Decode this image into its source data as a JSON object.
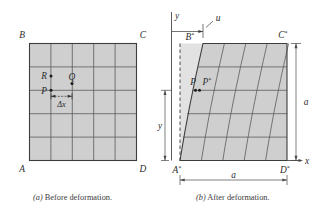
{
  "figure": {
    "captions": {
      "a_prefix": "(a)",
      "a_text": "Before deformation.",
      "b_prefix": "(b)",
      "b_text": "After deformation."
    },
    "colors": {
      "fill": "#cfcfcf",
      "fill_shadow": "#dcdcdc",
      "grid": "#5a5a5a",
      "outline": "#3c3c3c",
      "text": "#2b2b2b",
      "background": "#ffffff"
    },
    "grid_divisions": 5
  },
  "before": {
    "corners": {
      "top_left": "B",
      "top_right": "C",
      "bottom_left": "A",
      "bottom_right": "D"
    },
    "points": {
      "p": "P",
      "q": "Q",
      "r": "R"
    },
    "dimension_label": "Δx"
  },
  "after": {
    "corners": {
      "top_left": "B",
      "top_left_sup": "*",
      "top_right": "C",
      "top_right_sup": "*",
      "bottom_left": "A",
      "bottom_left_sup": "*",
      "bottom_right": "D",
      "bottom_right_sup": "*"
    },
    "points": {
      "p": "P",
      "p_star": "P",
      "p_star_sup": "*"
    },
    "axes": {
      "x_label": "x",
      "y_label": "y"
    },
    "displacement_label": "u",
    "dimensions": {
      "width": "a",
      "height": "a",
      "vertical_position": "y"
    }
  }
}
